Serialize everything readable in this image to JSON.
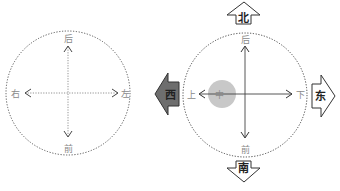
{
  "left_diagram": {
    "labels": {
      "top": "后",
      "bottom": "前",
      "left": "右",
      "right": "左"
    },
    "circle_style": "dotted",
    "axis_style": "dotted"
  },
  "right_diagram": {
    "labels": {
      "top": "后",
      "bottom": "前",
      "left": "上",
      "right": "下",
      "center": "中"
    },
    "circle_style": "dotted",
    "axis_style": "solid",
    "center_marker_color": "#c8c8c8"
  },
  "compass": {
    "north": "北",
    "south": "南",
    "west": "西",
    "east": "东",
    "west_fill": "#6e6e6e"
  }
}
